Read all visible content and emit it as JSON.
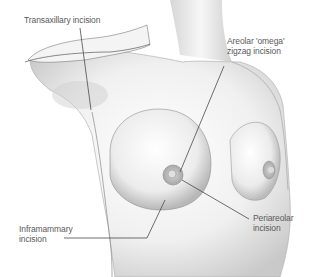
{
  "diagram": {
    "labels": {
      "transaxillary": "Transaxillary incision",
      "areolar_line1": "Areolar 'omega'",
      "areolar_line2": "zigzag incision",
      "inframammary_line1": "Inframammary",
      "inframammary_line2": "incision",
      "periareolar_line1": "Periareolar",
      "periareolar_line2": "incision"
    },
    "colors": {
      "background": "#ffffff",
      "body_shade": "#d8d8d8",
      "outline": "#6a6a6a",
      "leader_line": "#4a4a4a",
      "text": "#5a5a5a"
    }
  }
}
